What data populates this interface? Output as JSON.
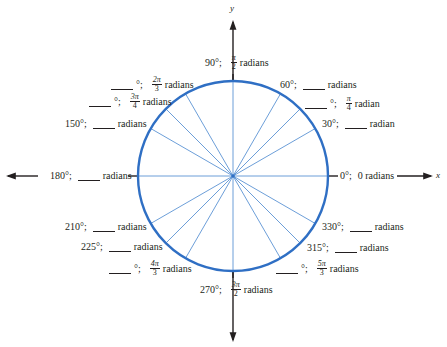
{
  "diagram": {
    "title": "",
    "center": {
      "x": 233,
      "y": 176
    },
    "radius": 95,
    "colors": {
      "circle": "#2f6fc4",
      "spokes": "#5b93d4",
      "axes": "#231f20",
      "text": "#231f20"
    },
    "axes": {
      "x_label": "x",
      "y_label": "y"
    },
    "angles_deg": [
      0,
      30,
      45,
      60,
      90,
      120,
      135,
      150,
      180,
      210,
      225,
      240,
      270,
      300,
      315,
      330
    ],
    "labels": {
      "a0": {
        "deg": "0°;",
        "rad_text": "0 radians"
      },
      "a30": {
        "deg": "30°;",
        "blank": true,
        "rad_text": "radian"
      },
      "a45": {
        "deg": "°;",
        "blank_deg": true,
        "num": "π",
        "den": "4",
        "rad_text": "radian"
      },
      "a60": {
        "deg": "60°;",
        "blank": true,
        "rad_text": "radians"
      },
      "a90": {
        "deg": "90°;",
        "num": "π",
        "den": "2",
        "rad_text": "radians"
      },
      "a120": {
        "deg": "°;",
        "blank_deg": true,
        "num": "2π",
        "den": "3",
        "rad_text": "radians"
      },
      "a135": {
        "deg": "°;",
        "blank_deg": true,
        "num": "3π",
        "den": "4",
        "rad_text": "radians"
      },
      "a150": {
        "deg": "150°;",
        "blank": true,
        "rad_text": "radians"
      },
      "a180": {
        "deg": "180°;",
        "blank": true,
        "rad_text": "radians"
      },
      "a210": {
        "deg": "210°;",
        "blank": true,
        "rad_text": "radians"
      },
      "a225": {
        "deg": "225°;",
        "blank": true,
        "rad_text": "radians"
      },
      "a240": {
        "deg": "°;",
        "blank_deg": true,
        "num": "4π",
        "den": "3",
        "rad_text": "radians"
      },
      "a270": {
        "deg": "270°;",
        "num": "3π",
        "den": "2",
        "rad_text": "radians"
      },
      "a300": {
        "deg": "°;",
        "blank_deg": true,
        "num": "5π",
        "den": "3",
        "rad_text": "radians"
      },
      "a315": {
        "deg": "315°;",
        "blank": true,
        "rad_text": "radians"
      },
      "a330": {
        "deg": "330°;",
        "blank": true,
        "rad_text": "radians"
      }
    }
  }
}
